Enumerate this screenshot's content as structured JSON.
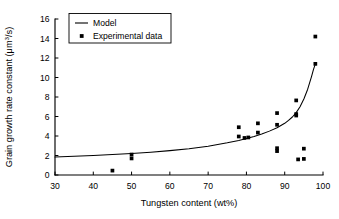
{
  "chart_data": {
    "type": "scatter",
    "title": "",
    "xlabel": "Tungsten content (wt%)",
    "ylabel_text": "Grain growth rate constant (",
    "ylabel_unit_base": "μm",
    "ylabel_unit_exp": "3",
    "ylabel_unit_tail": "/s)",
    "ylabel_full": "Grain growth rate constant (μm³/s)",
    "xlim": [
      30,
      100
    ],
    "ylim": [
      0,
      16
    ],
    "xticks": [
      30,
      40,
      50,
      60,
      70,
      80,
      90,
      100
    ],
    "yticks": [
      0,
      2,
      4,
      6,
      8,
      10,
      12,
      14,
      16
    ],
    "xtick_labels": [
      "30",
      "40",
      "50",
      "60",
      "70",
      "80",
      "90",
      "100"
    ],
    "ytick_labels": [
      "0",
      "2",
      "4",
      "6",
      "8",
      "10",
      "12",
      "14",
      "16"
    ],
    "grid": false,
    "legend_position": "top-left",
    "series": [
      {
        "name": "Model",
        "kind": "line",
        "color": "#000000",
        "points": [
          [
            30,
            1.85
          ],
          [
            35,
            1.92
          ],
          [
            40,
            2.0
          ],
          [
            45,
            2.1
          ],
          [
            50,
            2.2
          ],
          [
            55,
            2.33
          ],
          [
            60,
            2.5
          ],
          [
            65,
            2.7
          ],
          [
            70,
            2.95
          ],
          [
            75,
            3.3
          ],
          [
            78,
            3.55
          ],
          [
            80,
            3.75
          ],
          [
            82,
            3.95
          ],
          [
            84,
            4.2
          ],
          [
            86,
            4.5
          ],
          [
            88,
            4.85
          ],
          [
            90,
            5.3
          ],
          [
            91,
            5.6
          ],
          [
            92,
            5.95
          ],
          [
            93,
            6.4
          ],
          [
            94,
            7.0
          ],
          [
            95,
            7.8
          ],
          [
            96,
            8.8
          ],
          [
            97,
            10.1
          ],
          [
            97.5,
            10.8
          ],
          [
            98,
            11.4
          ]
        ]
      },
      {
        "name": "Experimental data",
        "kind": "scatter",
        "color": "#000000",
        "marker": "square",
        "points": [
          [
            45,
            0.45
          ],
          [
            50,
            1.7
          ],
          [
            50,
            2.1
          ],
          [
            78,
            3.95
          ],
          [
            78,
            4.9
          ],
          [
            79.5,
            3.8
          ],
          [
            80.5,
            3.85
          ],
          [
            83,
            4.35
          ],
          [
            83,
            5.3
          ],
          [
            88,
            5.15
          ],
          [
            88,
            6.35
          ],
          [
            88,
            2.45
          ],
          [
            88,
            2.75
          ],
          [
            93,
            6.1
          ],
          [
            93,
            6.25
          ],
          [
            93,
            7.65
          ],
          [
            93.5,
            1.6
          ],
          [
            95,
            2.7
          ],
          [
            95,
            1.65
          ],
          [
            98,
            11.4
          ],
          [
            98,
            14.2
          ]
        ]
      }
    ],
    "legend": [
      {
        "label": "Model",
        "symbol": "line"
      },
      {
        "label": "Experimental data",
        "symbol": "square"
      }
    ]
  }
}
